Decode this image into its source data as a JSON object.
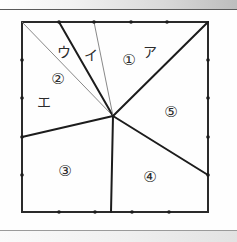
{
  "figure": {
    "colors": {
      "stroke_thick": "#1c1c1c",
      "stroke_thin": "#7a7a7a",
      "border": "#2a2a2a",
      "background": "#fefefe",
      "label": "#2b2b2b"
    },
    "square": {
      "left": 22,
      "top": 22,
      "right": 208,
      "bottom": 212,
      "tick_count_per_edge": 4
    },
    "center_point": {
      "x": 113,
      "y": 116
    },
    "region_labels": [
      {
        "id": "region-1",
        "text": "①",
        "x": 129,
        "y": 60
      },
      {
        "id": "region-2",
        "text": "②",
        "x": 58,
        "y": 79
      },
      {
        "id": "region-3",
        "text": "③",
        "x": 65,
        "y": 171
      },
      {
        "id": "region-4",
        "text": "④",
        "x": 150,
        "y": 177
      },
      {
        "id": "region-5",
        "text": "⑤",
        "x": 171,
        "y": 112
      }
    ],
    "vertex_labels": [
      {
        "id": "label-a",
        "text": "ア",
        "x": 150,
        "y": 52
      },
      {
        "id": "label-i",
        "text": "イ",
        "x": 91,
        "y": 55
      },
      {
        "id": "label-u",
        "text": "ウ",
        "x": 64,
        "y": 52
      },
      {
        "id": "label-e",
        "text": "エ",
        "x": 44,
        "y": 102
      }
    ],
    "edge_ticks": {
      "top": [
        {
          "x": 59,
          "y": 22
        },
        {
          "x": 94,
          "y": 22
        },
        {
          "x": 131,
          "y": 22
        },
        {
          "x": 167,
          "y": 22
        }
      ],
      "bottom": [
        {
          "x": 59,
          "y": 212
        },
        {
          "x": 95,
          "y": 212
        },
        {
          "x": 132,
          "y": 212
        },
        {
          "x": 169,
          "y": 212
        }
      ],
      "left": [
        {
          "x": 22,
          "y": 60
        },
        {
          "x": 22,
          "y": 98
        },
        {
          "x": 22,
          "y": 137
        },
        {
          "x": 22,
          "y": 175
        }
      ],
      "right": [
        {
          "x": 208,
          "y": 60
        },
        {
          "x": 208,
          "y": 98
        },
        {
          "x": 208,
          "y": 137
        },
        {
          "x": 208,
          "y": 175
        }
      ]
    },
    "segments": [
      {
        "id": "seg-corner-tl-to-center",
        "x1": 22,
        "y1": 22,
        "x2": 113,
        "y2": 116,
        "weight": "thin"
      },
      {
        "id": "seg-top-tick1-to-center",
        "x1": 59,
        "y1": 22,
        "x2": 113,
        "y2": 116,
        "weight": "thick"
      },
      {
        "id": "seg-top-tick2-to-center",
        "x1": 94,
        "y1": 22,
        "x2": 113,
        "y2": 116,
        "weight": "thin"
      },
      {
        "id": "seg-corner-tr-to-center",
        "x1": 208,
        "y1": 22,
        "x2": 113,
        "y2": 116,
        "weight": "thick"
      },
      {
        "id": "seg-right-to-center",
        "x1": 208,
        "y1": 175,
        "x2": 113,
        "y2": 116,
        "weight": "thick"
      },
      {
        "id": "seg-bottom-to-center",
        "x1": 111,
        "y1": 212,
        "x2": 113,
        "y2": 116,
        "weight": "thick"
      },
      {
        "id": "seg-left-to-center",
        "x1": 22,
        "y1": 137,
        "x2": 113,
        "y2": 116,
        "weight": "thick"
      }
    ]
  }
}
